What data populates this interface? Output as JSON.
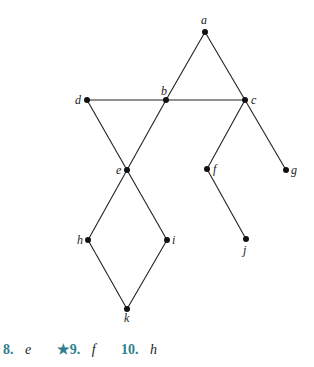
{
  "diagram": {
    "nodes": [
      {
        "id": "a",
        "x": 205,
        "y": 32,
        "lx": 201,
        "ly": 24
      },
      {
        "id": "b",
        "x": 166,
        "y": 100,
        "lx": 161,
        "ly": 95
      },
      {
        "id": "c",
        "x": 245,
        "y": 100,
        "lx": 251,
        "ly": 104
      },
      {
        "id": "d",
        "x": 87,
        "y": 100,
        "lx": 75,
        "ly": 104
      },
      {
        "id": "e",
        "x": 127,
        "y": 170,
        "lx": 116,
        "ly": 174
      },
      {
        "id": "f",
        "x": 207,
        "y": 169,
        "lx": 213,
        "ly": 173
      },
      {
        "id": "g",
        "x": 286,
        "y": 170,
        "lx": 291,
        "ly": 174
      },
      {
        "id": "h",
        "x": 88,
        "y": 240,
        "lx": 77,
        "ly": 244
      },
      {
        "id": "i",
        "x": 167,
        "y": 240,
        "lx": 172,
        "ly": 244
      },
      {
        "id": "j",
        "x": 246,
        "y": 239,
        "lx": 243,
        "ly": 254
      },
      {
        "id": "k",
        "x": 127,
        "y": 309,
        "lx": 124,
        "ly": 322
      }
    ],
    "edges": [
      [
        "a",
        "b"
      ],
      [
        "a",
        "c"
      ],
      [
        "d",
        "b"
      ],
      [
        "b",
        "c"
      ],
      [
        "d",
        "e"
      ],
      [
        "b",
        "e"
      ],
      [
        "c",
        "f"
      ],
      [
        "c",
        "g"
      ],
      [
        "f",
        "j"
      ],
      [
        "e",
        "h"
      ],
      [
        "e",
        "i"
      ],
      [
        "h",
        "k"
      ],
      [
        "i",
        "k"
      ]
    ]
  },
  "exercises": [
    {
      "number": "8.",
      "answer": "e"
    },
    {
      "number": "★9.",
      "answer": "f"
    },
    {
      "number": "10.",
      "answer": "h"
    }
  ]
}
